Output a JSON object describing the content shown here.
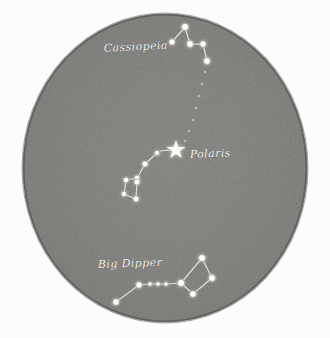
{
  "figure": {
    "medium": "pencil sketch",
    "background_color": "#fcfcfc",
    "disc": {
      "center_x": 165,
      "center_y": 168,
      "radius_x": 142,
      "radius_y": 154,
      "rim_color": "#4a4a48",
      "core_color": "#a8a8a4"
    }
  },
  "labels": [
    {
      "id": "cassiopeia",
      "text": "Cassiopeia",
      "x": 104,
      "y": 52,
      "rotation": -3,
      "font_size": 11,
      "color": "#f2f2ef"
    },
    {
      "id": "polaris",
      "text": "Polaris",
      "x": 190,
      "y": 158,
      "rotation": -2,
      "font_size": 11,
      "color": "#f2f2ef"
    },
    {
      "id": "big-dipper",
      "text": "Big Dipper",
      "x": 98,
      "y": 268,
      "rotation": -2,
      "font_size": 11,
      "color": "#f2f2ef"
    }
  ],
  "chart_data": {
    "type": "scatter",
    "xlabel": "",
    "ylabel": "",
    "xlim": [
      0,
      330
    ],
    "ylim": [
      0,
      338
    ],
    "grid": false,
    "legend": "none",
    "annotations": [
      "Cassiopeia",
      "Polaris",
      "Big Dipper"
    ],
    "pole_star": {
      "name": "Polaris",
      "x": 176,
      "y": 150,
      "glyph": "five-pointed-star",
      "size": 14
    },
    "constellations": [
      {
        "name": "Cassiopeia",
        "label": "Cassiopeia",
        "stars": [
          {
            "x": 172,
            "y": 42,
            "r": 3.1
          },
          {
            "x": 185,
            "y": 27,
            "r": 3.6
          },
          {
            "x": 190,
            "y": 44,
            "r": 3.4
          },
          {
            "x": 203,
            "y": 44,
            "r": 3.2
          },
          {
            "x": 207,
            "y": 61,
            "r": 3.4
          }
        ],
        "links": [
          [
            0,
            1
          ],
          [
            1,
            2
          ],
          [
            2,
            3
          ],
          [
            3,
            4
          ]
        ]
      },
      {
        "name": "Little Dipper",
        "label": "",
        "stars": [
          {
            "x": 157,
            "y": 153,
            "r": 2.6
          },
          {
            "x": 145,
            "y": 164,
            "r": 3.0
          },
          {
            "x": 137,
            "y": 178,
            "r": 2.8
          },
          {
            "x": 137,
            "y": 182,
            "r": 3.0
          },
          {
            "x": 126,
            "y": 180,
            "r": 2.8
          },
          {
            "x": 124,
            "y": 194,
            "r": 2.7
          },
          {
            "x": 136,
            "y": 199,
            "r": 3.0
          }
        ],
        "links": [
          [
            0,
            1
          ],
          [
            1,
            2
          ],
          [
            2,
            4
          ],
          [
            4,
            5
          ],
          [
            5,
            6
          ],
          [
            6,
            3
          ],
          [
            3,
            2
          ]
        ]
      },
      {
        "name": "Big Dipper",
        "label": "Big Dipper",
        "stars": [
          {
            "x": 116,
            "y": 302,
            "r": 3.3
          },
          {
            "x": 139,
            "y": 285,
            "r": 3.2
          },
          {
            "x": 150,
            "y": 284,
            "r": 2.2
          },
          {
            "x": 158,
            "y": 284,
            "r": 2.2
          },
          {
            "x": 166,
            "y": 284,
            "r": 2.2
          },
          {
            "x": 181,
            "y": 283,
            "r": 3.6
          },
          {
            "x": 202,
            "y": 258,
            "r": 3.5
          },
          {
            "x": 212,
            "y": 278,
            "r": 3.4
          },
          {
            "x": 193,
            "y": 294,
            "r": 3.3
          }
        ],
        "links": [
          [
            0,
            1
          ],
          [
            1,
            2
          ],
          [
            2,
            3
          ],
          [
            3,
            4
          ],
          [
            4,
            5
          ],
          [
            5,
            6
          ],
          [
            6,
            7
          ],
          [
            7,
            8
          ],
          [
            8,
            5
          ]
        ]
      }
    ],
    "pointer_trail": {
      "from": "Cassiopeia",
      "to": "Polaris",
      "points": [
        {
          "x": 205,
          "y": 72
        },
        {
          "x": 202,
          "y": 84
        },
        {
          "x": 199,
          "y": 96
        },
        {
          "x": 196,
          "y": 108
        },
        {
          "x": 193,
          "y": 120
        },
        {
          "x": 189,
          "y": 131
        },
        {
          "x": 185,
          "y": 141
        }
      ]
    },
    "polaris_tick": {
      "x1": 160,
      "y1": 151,
      "x2": 170,
      "y2": 150
    }
  }
}
